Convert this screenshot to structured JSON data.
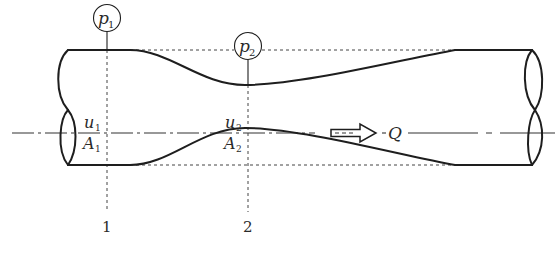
{
  "diagram": {
    "type": "venturi-tube",
    "flow_label": "Q",
    "stations": [
      {
        "id": "1",
        "pressure_label": "p",
        "pressure_sub": "1",
        "velocity_label": "u",
        "velocity_sub": "1",
        "area_label": "A",
        "area_sub": "1"
      },
      {
        "id": "2",
        "pressure_label": "p",
        "pressure_sub": "2",
        "velocity_label": "u",
        "velocity_sub": "2",
        "area_label": "A",
        "area_sub": "2"
      }
    ],
    "colors": {
      "line": "#1e1e1e",
      "dashed": "#444444",
      "background": "#ffffff"
    }
  }
}
